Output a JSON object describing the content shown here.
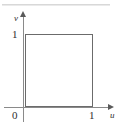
{
  "figure": {
    "name": "unit-square-uv-plane",
    "background_color": "#ffffff",
    "line_color": "#6b6b6b",
    "axis_color": "#8a8a8a",
    "text_color": "#2e2e2e",
    "top_rule_color": "#d8d8d8"
  },
  "axes": {
    "horizontal_label": "u",
    "vertical_label": "v",
    "origin_label": "0",
    "horizontal_tick_label": "1",
    "vertical_tick_label": "1"
  },
  "chart_data": {
    "type": "line",
    "title": "",
    "subtitle": "",
    "xlabel": "u",
    "ylabel": "v",
    "xlim": [
      0,
      1.25
    ],
    "ylim": [
      0,
      1.25
    ],
    "xticks": [
      0,
      1
    ],
    "xticklabels": [
      "0",
      "1"
    ],
    "yticks": [
      0,
      1
    ],
    "yticklabels": [
      "0",
      "1"
    ],
    "grid": false,
    "legend": null,
    "series": [
      {
        "name": "unit-square-boundary",
        "closed": true,
        "fill": "none",
        "stroke": "#6b6b6b",
        "x": [
          0,
          1,
          1,
          0,
          0
        ],
        "y": [
          0,
          0,
          1,
          1,
          0
        ]
      }
    ],
    "annotations": []
  }
}
